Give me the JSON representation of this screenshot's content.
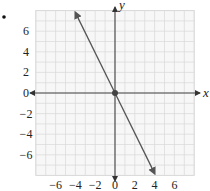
{
  "chart_data": {
    "type": "line",
    "title": "",
    "xlabel": "x",
    "ylabel": "y",
    "xlim": [
      -8,
      8
    ],
    "ylim": [
      -8,
      8
    ],
    "grid": true,
    "x_ticks": [
      -6,
      -4,
      -2,
      0,
      2,
      4,
      6
    ],
    "y_ticks": [
      6,
      4,
      2,
      0,
      -2,
      -4,
      -6
    ],
    "x_tick_labels": [
      "−6",
      "−4",
      "−2",
      "0",
      "2",
      "4",
      "6"
    ],
    "y_tick_labels": [
      "6",
      "4",
      "2",
      "0",
      "−2",
      "−4",
      "−6"
    ],
    "series": [
      {
        "name": "y = -2x",
        "equation": "y = -2x",
        "x": [
          -4,
          0,
          4
        ],
        "y": [
          8,
          0,
          -8
        ],
        "arrows_both_ends": true,
        "marked_point": [
          0,
          0
        ],
        "color": "#555555"
      }
    ],
    "legend": null
  },
  "labels": {
    "x_axis": "x",
    "y_axis": "y"
  },
  "colors": {
    "grid": "#d8d8d8",
    "axis": "#444444",
    "line": "#555555",
    "text": "#222222"
  }
}
